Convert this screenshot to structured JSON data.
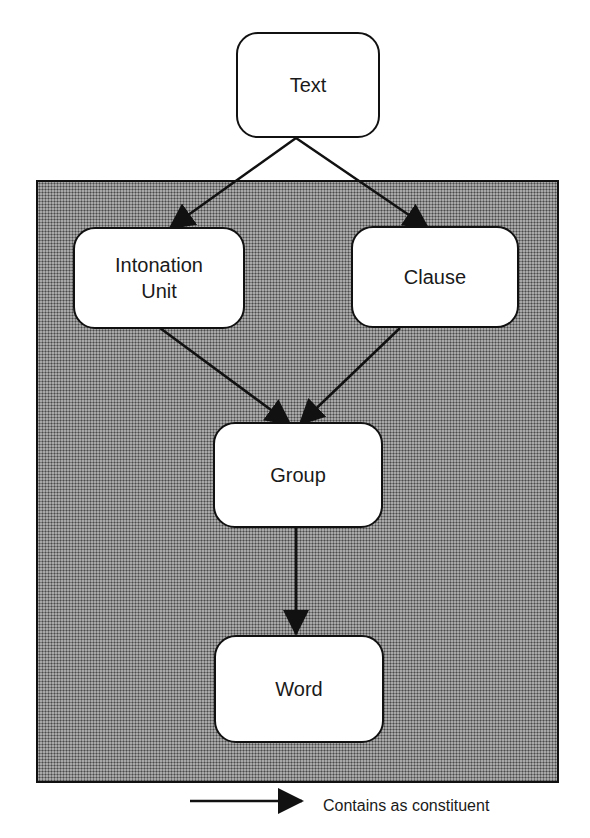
{
  "diagram": {
    "nodes": [
      {
        "id": "text",
        "label": "Text"
      },
      {
        "id": "intonation-unit",
        "label": "Intonation\nUnit"
      },
      {
        "id": "clause",
        "label": "Clause"
      },
      {
        "id": "group",
        "label": "Group"
      },
      {
        "id": "word",
        "label": "Word"
      }
    ],
    "edges": [
      {
        "from": "text",
        "to": "intonation-unit"
      },
      {
        "from": "text",
        "to": "clause"
      },
      {
        "from": "intonation-unit",
        "to": "group"
      },
      {
        "from": "clause",
        "to": "group"
      },
      {
        "from": "group",
        "to": "word"
      }
    ],
    "legend": {
      "label": "Contains as constituent",
      "symbol": "arrow"
    }
  }
}
